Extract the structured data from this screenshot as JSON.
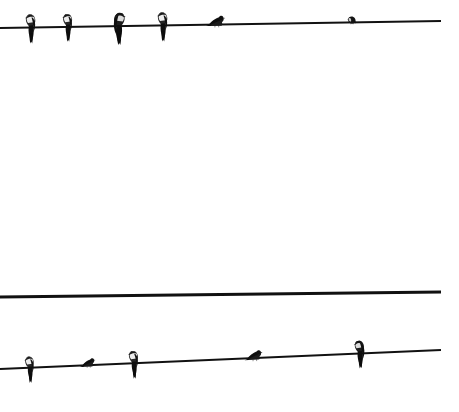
{
  "scene": {
    "title": "Birds perched on utility wires",
    "width": 459,
    "height": 412,
    "background_color": "#ffffff",
    "wire_color": "#111111",
    "bird_color": "#151515"
  },
  "wires": [
    {
      "id": "top-wire",
      "x1": 0,
      "y1": 28,
      "x2": 441,
      "y2": 21,
      "thickness": 2.0,
      "bird_count": 6
    },
    {
      "id": "middle-wire",
      "x1": 0,
      "y1": 297,
      "x2": 441,
      "y2": 292,
      "thickness": 2.8,
      "bird_count": 0
    },
    {
      "id": "bottom-wire",
      "x1": 0,
      "y1": 369,
      "x2": 441,
      "y2": 350,
      "thickness": 1.8,
      "bird_count": 5
    }
  ],
  "birds": [
    {
      "id": "bird-1",
      "wire": "top-wire",
      "x": 31,
      "y": 27,
      "pose": "perched-upright",
      "facing": "right",
      "scale": 1.0
    },
    {
      "id": "bird-2",
      "wire": "top-wire",
      "x": 68,
      "y": 26,
      "pose": "perched-upright",
      "facing": "right",
      "scale": 0.95
    },
    {
      "id": "bird-3",
      "wire": "top-wire",
      "x": 119,
      "y": 26,
      "pose": "perched-forward-lean",
      "facing": "left",
      "scale": 1.05
    },
    {
      "id": "bird-4",
      "wire": "top-wire",
      "x": 163,
      "y": 25,
      "pose": "perched-upright",
      "facing": "right",
      "scale": 1.0
    },
    {
      "id": "bird-5",
      "wire": "top-wire",
      "x": 216,
      "y": 24,
      "pose": "crouched-landing",
      "facing": "left",
      "scale": 0.85
    },
    {
      "id": "bird-6",
      "wire": "top-wire",
      "x": 352,
      "y": 22,
      "pose": "compact-puffed",
      "facing": "right",
      "scale": 0.6
    },
    {
      "id": "bird-7",
      "wire": "bottom-wire",
      "x": 30,
      "y": 368,
      "pose": "perched-upright",
      "facing": "right",
      "scale": 0.9
    },
    {
      "id": "bird-8",
      "wire": "bottom-wire",
      "x": 88,
      "y": 365,
      "pose": "crouched-landing",
      "facing": "left",
      "scale": 0.7
    },
    {
      "id": "bird-9",
      "wire": "bottom-wire",
      "x": 134,
      "y": 363,
      "pose": "perched-upright",
      "facing": "right",
      "scale": 0.95
    },
    {
      "id": "bird-10",
      "wire": "bottom-wire",
      "x": 254,
      "y": 358,
      "pose": "crouched-landing",
      "facing": "left",
      "scale": 0.8
    },
    {
      "id": "bird-11",
      "wire": "bottom-wire",
      "x": 360,
      "y": 352,
      "pose": "perched-forward-lean",
      "facing": "right",
      "scale": 0.9
    }
  ]
}
